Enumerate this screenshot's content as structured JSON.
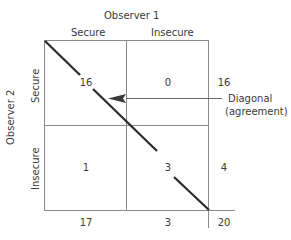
{
  "observer1": {
    "label": "Observer 1",
    "columns": [
      "Secure",
      "Insecure"
    ]
  },
  "observer2": {
    "label": "Observer 2",
    "rows": [
      "Secure",
      "Insecure"
    ]
  },
  "cells": {
    "secure_secure": "16",
    "secure_insecure": "0",
    "insecure_secure": "1",
    "insecure_insecure": "3"
  },
  "row_totals": [
    "16",
    "4"
  ],
  "column_totals": [
    "17",
    "3"
  ],
  "grand_total": "20",
  "annotation": {
    "line1": "Diagonal",
    "line2": "(agreement)"
  },
  "colors": {
    "grid": "#8a8a8a",
    "diagonal": "#2a2a2a",
    "text": "#3a3a3a"
  }
}
